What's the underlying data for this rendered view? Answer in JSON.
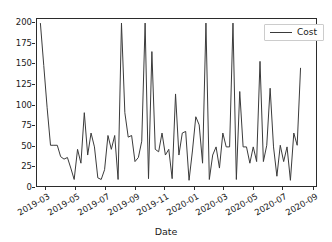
{
  "chart_data": {
    "type": "line",
    "title": "",
    "xlabel": "Date",
    "ylabel": "",
    "grid": false,
    "legend_position": "upper right",
    "ylim": [
      0,
      205
    ],
    "yticks": [
      0,
      25,
      50,
      75,
      100,
      125,
      150,
      175,
      200
    ],
    "ytick_labels": [
      "0",
      "25",
      "50",
      "75",
      "100",
      "125",
      "150",
      "175",
      "200"
    ],
    "xlim": [
      "2019-02-10",
      "2020-09-10"
    ],
    "xticks": [
      "2019-03",
      "2019-05",
      "2019-07",
      "2019-09",
      "2019-11",
      "2020-01",
      "2020-03",
      "2020-05",
      "2020-07",
      "2020-09"
    ],
    "xtick_labels": [
      "2019-03",
      "2019-05",
      "2019-07",
      "2019-09",
      "2019-11",
      "2020-01",
      "2020-03",
      "2020-05",
      "2020-07",
      "2020-09"
    ],
    "line_color": "#3a3a3a",
    "line_width": 1.0,
    "series": [
      {
        "name": "Cost",
        "x": [
          "2019-02-17",
          "2019-02-24",
          "2019-03-03",
          "2019-03-10",
          "2019-03-17",
          "2019-03-24",
          "2019-03-31",
          "2019-04-07",
          "2019-04-14",
          "2019-04-21",
          "2019-04-28",
          "2019-05-05",
          "2019-05-12",
          "2019-05-19",
          "2019-05-26",
          "2019-06-02",
          "2019-06-09",
          "2019-06-16",
          "2019-06-23",
          "2019-06-30",
          "2019-07-07",
          "2019-07-14",
          "2019-07-21",
          "2019-07-28",
          "2019-08-04",
          "2019-08-11",
          "2019-08-18",
          "2019-08-25",
          "2019-09-01",
          "2019-09-08",
          "2019-09-15",
          "2019-09-22",
          "2019-09-29",
          "2019-10-06",
          "2019-10-13",
          "2019-10-20",
          "2019-10-27",
          "2019-11-03",
          "2019-11-10",
          "2019-11-17",
          "2019-11-24",
          "2019-12-01",
          "2019-12-08",
          "2019-12-15",
          "2019-12-22",
          "2019-12-29",
          "2020-01-05",
          "2020-01-12",
          "2020-01-19",
          "2020-01-26",
          "2020-02-02",
          "2020-02-09",
          "2020-02-16",
          "2020-02-23",
          "2020-03-01",
          "2020-03-08",
          "2020-03-15",
          "2020-03-22",
          "2020-03-29",
          "2020-04-05",
          "2020-04-12",
          "2020-04-19",
          "2020-04-26",
          "2020-05-03",
          "2020-05-10",
          "2020-05-17",
          "2020-05-24",
          "2020-05-31",
          "2020-06-07",
          "2020-06-14",
          "2020-06-21",
          "2020-06-28",
          "2020-07-05",
          "2020-07-12",
          "2020-07-19",
          "2020-07-26",
          "2020-08-02",
          "2020-08-09"
        ],
        "values": [
          200,
          148,
          96,
          50,
          50,
          50,
          36,
          33,
          35,
          22,
          8,
          45,
          28,
          90,
          38,
          65,
          48,
          10,
          8,
          20,
          62,
          45,
          62,
          8,
          200,
          90,
          60,
          62,
          30,
          35,
          55,
          200,
          9,
          165,
          45,
          42,
          65,
          38,
          45,
          9,
          113,
          38,
          65,
          67,
          7,
          43,
          85,
          75,
          28,
          200,
          8,
          38,
          48,
          22,
          65,
          48,
          48,
          200,
          8,
          116,
          48,
          48,
          28,
          48,
          30,
          153,
          30,
          50,
          120,
          48,
          12,
          50,
          30,
          48,
          7,
          65,
          50,
          145
        ]
      }
    ]
  },
  "legend": {
    "label": "Cost"
  },
  "axis": {
    "xlabel": "Date"
  }
}
